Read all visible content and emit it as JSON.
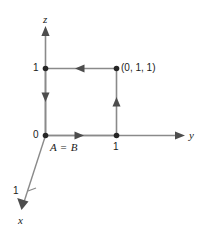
{
  "figure": {
    "kind": "3d-coordinate-axes-diagram",
    "stroke_color": "#4d4d4d",
    "text_color": "#1a1a1a",
    "axes": [
      {
        "name": "z",
        "label": "z",
        "direction": "up"
      },
      {
        "name": "y",
        "label": "y",
        "direction": "right"
      },
      {
        "name": "x",
        "label": "x",
        "direction": "down-left"
      }
    ],
    "tick_labels": {
      "origin": "0",
      "z_one": "1",
      "y_one": "1",
      "x_one": "1"
    },
    "point_labels": {
      "vertex": "(0, 1, 1)",
      "start_end": "A = B"
    },
    "path_arrows": [
      {
        "name": "bottom-edge-arrow",
        "direction": "right"
      },
      {
        "name": "right-edge-arrow",
        "direction": "up"
      },
      {
        "name": "top-edge-arrow",
        "direction": "left"
      },
      {
        "name": "left-edge-arrow",
        "direction": "down"
      }
    ],
    "dots": [
      {
        "name": "origin-dot"
      },
      {
        "name": "y-one-dot"
      },
      {
        "name": "z-one-dot"
      },
      {
        "name": "vertex-dot"
      }
    ]
  }
}
